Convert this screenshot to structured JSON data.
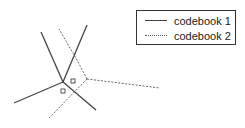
{
  "diagram": {
    "colors": {
      "solid": "#444444",
      "dashed": "#666666",
      "square": "#444444"
    },
    "legend": {
      "items": [
        {
          "label": "codebook 1",
          "style": "solid"
        },
        {
          "label": "codebook 2",
          "style": "dashed"
        }
      ]
    },
    "codebook1_edges": [
      [
        [
          63,
          82
        ],
        [
          41,
          32
        ]
      ],
      [
        [
          63,
          82
        ],
        [
          87,
          25
        ]
      ],
      [
        [
          63,
          82
        ],
        [
          14,
          103
        ]
      ],
      [
        [
          63,
          82
        ],
        [
          96,
          110
        ]
      ]
    ],
    "codebook2_edges": [
      [
        [
          87,
          79
        ],
        [
          77,
          60
        ],
        [
          59,
          29
        ]
      ],
      [
        [
          87,
          79
        ],
        [
          160,
          88
        ]
      ],
      [
        [
          87,
          79
        ],
        [
          49,
          118
        ]
      ]
    ],
    "squares": [
      {
        "x": 73,
        "y": 81,
        "size": 4
      },
      {
        "x": 63,
        "y": 91,
        "size": 4
      }
    ]
  }
}
